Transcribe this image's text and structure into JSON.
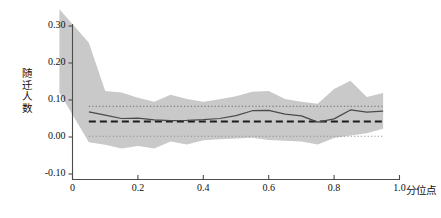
{
  "chart_data": {
    "type": "line",
    "title": "",
    "subtitle": "",
    "xlabel": "分位点",
    "ylabel": "随迁人数",
    "ylabel_chars": [
      "随",
      "迁",
      "人",
      "数"
    ],
    "xlim": [
      0.0,
      1.0
    ],
    "ylim": [
      -0.12,
      0.345
    ],
    "xticks": [
      0,
      0.2,
      0.4,
      0.6,
      0.8,
      1.0
    ],
    "xticklabels": [
      "0",
      "0.2",
      "0.4",
      "0.6",
      "0.8",
      "1.0"
    ],
    "yticks": [
      -0.1,
      0.0,
      0.1,
      0.2,
      0.3
    ],
    "yticklabels": [
      "-0.10",
      "0.00",
      "0.10",
      "0.20",
      "0.30"
    ],
    "grid": false,
    "legend": "none",
    "x": [
      0.05,
      0.1,
      0.15,
      0.2,
      0.25,
      0.3,
      0.35,
      0.4,
      0.45,
      0.5,
      0.55,
      0.6,
      0.65,
      0.7,
      0.75,
      0.8,
      0.85,
      0.9,
      0.95
    ],
    "series": [
      {
        "name": "分位数回归系数",
        "style": "solid",
        "color": "#555555",
        "values": [
          0.068,
          0.059,
          0.05,
          0.051,
          0.046,
          0.044,
          0.045,
          0.047,
          0.05,
          0.058,
          0.071,
          0.072,
          0.062,
          0.057,
          0.04,
          0.049,
          0.073,
          0.067,
          0.07
        ]
      },
      {
        "name": "OLS系数",
        "style": "dashed",
        "color": "#222222",
        "values": [
          0.042,
          0.042,
          0.042,
          0.042,
          0.042,
          0.042,
          0.042,
          0.042,
          0.042,
          0.042,
          0.042,
          0.042,
          0.042,
          0.042,
          0.042,
          0.042,
          0.042,
          0.042,
          0.042
        ]
      },
      {
        "name": "OLS置信区间上限",
        "style": "dotted",
        "color": "#666666",
        "values": [
          0.083,
          0.083,
          0.083,
          0.083,
          0.083,
          0.083,
          0.083,
          0.083,
          0.083,
          0.083,
          0.083,
          0.083,
          0.083,
          0.083,
          0.083,
          0.083,
          0.083,
          0.083,
          0.083
        ]
      },
      {
        "name": "OLS置信区间下限",
        "style": "dotted",
        "color": "#888888",
        "values": [
          0.002,
          0.002,
          0.002,
          0.002,
          0.002,
          0.002,
          0.002,
          0.002,
          0.002,
          0.002,
          0.002,
          0.002,
          0.002,
          0.002,
          0.002,
          0.002,
          0.002,
          0.002,
          0.002
        ]
      }
    ],
    "band": {
      "name": "分位数回归置信区间",
      "fill_color": "#c9c9c9",
      "x_start": -0.04,
      "upper_start": 0.345,
      "lower_start": 0.12,
      "upper": [
        0.267,
        0.255,
        0.124,
        0.12,
        0.106,
        0.095,
        0.114,
        0.103,
        0.095,
        0.102,
        0.11,
        0.122,
        0.124,
        0.103,
        0.095,
        0.09,
        0.13,
        0.152,
        0.108,
        0.119
      ],
      "lower": [
        -0.115,
        -0.014,
        -0.021,
        -0.031,
        -0.024,
        -0.031,
        -0.012,
        -0.02,
        -0.009,
        -0.006,
        -0.004,
        -0.002,
        -0.008,
        -0.01,
        -0.012,
        -0.02,
        -0.003,
        0.004,
        0.01,
        0.022
      ]
    }
  }
}
